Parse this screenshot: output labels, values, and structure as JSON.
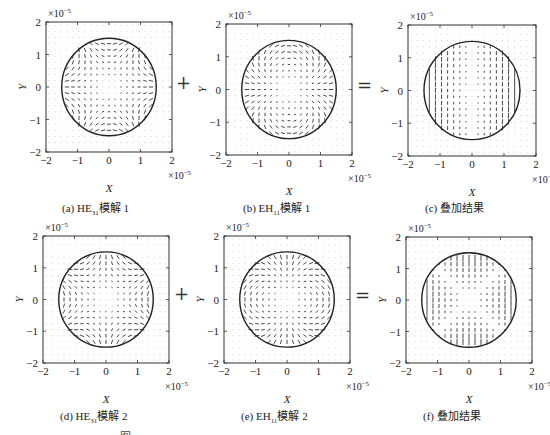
{
  "figure": {
    "panels": [
      {
        "id": "a",
        "caption_prefix": "(a) HE",
        "caption_sub": "31",
        "caption_suffix": "模解 1",
        "mode": "he31_1"
      },
      {
        "id": "b",
        "caption_prefix": "(b) EH",
        "caption_sub": "11",
        "caption_suffix": "模解 1",
        "mode": "eh11_1"
      },
      {
        "id": "c",
        "caption_prefix": "(c) 叠加结果",
        "caption_sub": "",
        "caption_suffix": "",
        "mode": "sum_1"
      },
      {
        "id": "d",
        "caption_prefix": "(d) HE",
        "caption_sub": "31",
        "caption_suffix": "模解 2",
        "mode": "he31_2"
      },
      {
        "id": "e",
        "caption_prefix": "(e) EH",
        "caption_sub": "11",
        "caption_suffix": "模解 2",
        "mode": "eh11_2"
      },
      {
        "id": "f",
        "caption_prefix": "(f) 叠加结果",
        "caption_sub": "",
        "caption_suffix": "",
        "mode": "sum_2"
      }
    ],
    "operators": {
      "plus": "+",
      "equals": "="
    },
    "axis": {
      "xlabel": "X",
      "ylabel": "Y",
      "ticks": [
        "−2",
        "−1",
        "0",
        "1",
        "2"
      ],
      "y_multiplier": "×10",
      "x_multiplier": "×10",
      "exponent": "−5"
    },
    "fig_caption": "图"
  },
  "chart_data": [
    {
      "type": "scatter",
      "subtype": "quiver",
      "title": "(a) HE31模解 1",
      "xlabel": "X",
      "ylabel": "Y",
      "xlim": [
        -2e-05,
        2e-05
      ],
      "ylim": [
        -2e-05,
        2e-05
      ],
      "xticks": [
        -2,
        -1,
        0,
        1,
        2
      ],
      "yticks": [
        -2,
        -1,
        0,
        1,
        2
      ],
      "scale": "×10^-5",
      "annotation": "circular core boundary radius ≈1.5×10^-5",
      "pattern": "HE31 hexapolar transverse field, field lines radial along x-axis"
    },
    {
      "type": "scatter",
      "subtype": "quiver",
      "title": "(b) EH11模解 1",
      "xlabel": "X",
      "ylabel": "Y",
      "xlim": [
        -2e-05,
        2e-05
      ],
      "ylim": [
        -2e-05,
        2e-05
      ],
      "xticks": [
        -2,
        -1,
        0,
        1,
        2
      ],
      "yticks": [
        -2,
        -1,
        0,
        1,
        2
      ],
      "scale": "×10^-5",
      "annotation": "circular core boundary radius ≈1.5×10^-5",
      "pattern": "EH11 dipolar field circulating around two lobes"
    },
    {
      "type": "scatter",
      "subtype": "quiver",
      "title": "(c) 叠加结果",
      "xlabel": "X",
      "ylabel": "Y",
      "xlim": [
        -2e-05,
        2e-05
      ],
      "ylim": [
        -2e-05,
        2e-05
      ],
      "xticks": [
        -2,
        -1,
        0,
        1,
        2
      ],
      "yticks": [
        -2,
        -1,
        0,
        1,
        2
      ],
      "scale": "×10^-5",
      "annotation": "circular core boundary radius ≈1.5×10^-5",
      "pattern": "vertically polarized field in two lobes (left and right), null at center"
    },
    {
      "type": "scatter",
      "subtype": "quiver",
      "title": "(d) HE31模解 2",
      "xlabel": "X",
      "ylabel": "Y",
      "xlim": [
        -2e-05,
        2e-05
      ],
      "ylim": [
        -2e-05,
        2e-05
      ],
      "xticks": [
        -2,
        -1,
        0,
        1,
        2
      ],
      "yticks": [
        -2,
        -1,
        0,
        1,
        2
      ],
      "scale": "×10^-5",
      "annotation": "circular core boundary radius ≈1.5×10^-5",
      "pattern": "HE31 hexapolar transverse field rotated, field lines radial along y-axis"
    },
    {
      "type": "scatter",
      "subtype": "quiver",
      "title": "(e) EH11模解 2",
      "xlabel": "X",
      "ylabel": "Y",
      "xlim": [
        -2e-05,
        2e-05
      ],
      "ylim": [
        -2e-05,
        2e-05
      ],
      "xticks": [
        -2,
        -1,
        0,
        1,
        2
      ],
      "yticks": [
        -2,
        -1,
        0,
        1,
        2
      ],
      "scale": "×10^-5",
      "annotation": "circular core boundary radius ≈1.5×10^-5",
      "pattern": "EH11 dipolar field rotated 90°"
    },
    {
      "type": "scatter",
      "subtype": "quiver",
      "title": "(f) 叠加结果",
      "xlabel": "X",
      "ylabel": "Y",
      "xlim": [
        -2e-05,
        2e-05
      ],
      "ylim": [
        -2e-05,
        2e-05
      ],
      "xticks": [
        -2,
        -1,
        0,
        1,
        2
      ],
      "yticks": [
        -2,
        -1,
        0,
        1,
        2
      ],
      "scale": "×10^-5",
      "annotation": "circular core boundary radius ≈1.5×10^-5",
      "pattern": "vertically polarized field in four lobes (top, bottom, left, right), null at center"
    }
  ]
}
